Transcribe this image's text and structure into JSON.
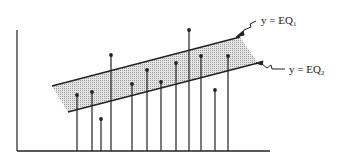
{
  "labels": {
    "eq1": {
      "prefix": "y = EQ",
      "sub": "1"
    },
    "eq2": {
      "prefix": "y = EQ",
      "sub": "2"
    }
  },
  "colors": {
    "ink": "#222222",
    "band_fill": "#d4d4d4",
    "background": "#ffffff"
  },
  "band": {
    "upper_line": [
      [
        52,
        86
      ],
      [
        240,
        37
      ]
    ],
    "lower_line": [
      [
        68,
        112
      ],
      [
        258,
        63
      ]
    ]
  },
  "axes": {
    "y_axis": [
      [
        17,
        30
      ],
      [
        17,
        151
      ]
    ],
    "x_axis": [
      [
        17,
        151
      ],
      [
        270,
        151
      ]
    ]
  },
  "stems": [
    {
      "x": 77,
      "top": 95
    },
    {
      "x": 92,
      "top": 92
    },
    {
      "x": 101,
      "top": 119
    },
    {
      "x": 111,
      "top": 55
    },
    {
      "x": 132,
      "top": 84
    },
    {
      "x": 147,
      "top": 70
    },
    {
      "x": 161,
      "top": 82
    },
    {
      "x": 176,
      "top": 63
    },
    {
      "x": 189,
      "top": 30
    },
    {
      "x": 201,
      "top": 56
    },
    {
      "x": 215,
      "top": 90
    },
    {
      "x": 228,
      "top": 56
    }
  ]
}
